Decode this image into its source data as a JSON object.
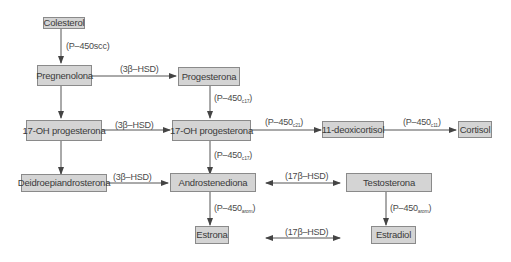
{
  "diagram": {
    "type": "steroidogenesis-pathway",
    "nodes": {
      "colesterol": "Colesterol",
      "pregnenolona": "Pregnenolona",
      "progesterona": "Progesterona",
      "oh17_progesterona_left": "17-OH progesterona",
      "oh17_progesterona_mid": "17-OH progesterona",
      "deoxicortisol": "11-deoxicortisol",
      "cortisol": "Cortisol",
      "deidroepiandrosterona": "Deidroepiandrosterona",
      "androstenediona": "Androstenediona",
      "testosterona": "Testosterona",
      "estrona": "Estrona",
      "estradiol": "Estradiol"
    },
    "enzymes": {
      "p450scc": "(P–450scc)",
      "hsd3b_1": "(3β–HSD)",
      "hsd3b_2": "(3β–HSD)",
      "hsd3b_3": "(3β–HSD)",
      "p450c17_1": {
        "base": "(P–450",
        "sub": "c17",
        "close": ")"
      },
      "p450c21": {
        "base": "(P–450",
        "sub": "c21",
        "close": ")"
      },
      "p450c11": {
        "base": "(P–450",
        "sub": "c11",
        "close": ")"
      },
      "p450c17_2": {
        "base": "(P–450",
        "sub": "c17",
        "close": ")"
      },
      "hsd17b_1": "(17β–HSD)",
      "hsd17b_2": "(17β–HSD)",
      "p450arom_1": {
        "base": "(P–450",
        "sub": "arom",
        "close": ")"
      },
      "p450arom_2": {
        "base": "(P–450",
        "sub": "arom",
        "close": ")"
      }
    },
    "edges": [
      {
        "from": "Colesterol",
        "to": "Pregnenolona",
        "enzyme": "P-450scc"
      },
      {
        "from": "Pregnenolona",
        "to": "Progesterona",
        "enzyme": "3β-HSD"
      },
      {
        "from": "Pregnenolona",
        "to": "17-OH progesterona (left)",
        "enzyme": ""
      },
      {
        "from": "Progesterona",
        "to": "17-OH progesterona",
        "enzyme": "P-450c17"
      },
      {
        "from": "17-OH progesterona (left)",
        "to": "17-OH progesterona",
        "enzyme": "3β-HSD"
      },
      {
        "from": "17-OH progesterona",
        "to": "11-deoxicortisol",
        "enzyme": "P-450c21"
      },
      {
        "from": "11-deoxicortisol",
        "to": "Cortisol",
        "enzyme": "P-450c11"
      },
      {
        "from": "17-OH progesterona (left)",
        "to": "Deidroepiandrosterona",
        "enzyme": ""
      },
      {
        "from": "17-OH progesterona",
        "to": "Androstenediona",
        "enzyme": "P-450c17"
      },
      {
        "from": "Deidroepiandrosterona",
        "to": "Androstenediona",
        "enzyme": "3β-HSD"
      },
      {
        "from": "Androstenediona",
        "to": "Testosterona",
        "enzyme": "17β-HSD",
        "bidirectional": true
      },
      {
        "from": "Androstenediona",
        "to": "Estrona",
        "enzyme": "P-450arom"
      },
      {
        "from": "Testosterona",
        "to": "Estradiol",
        "enzyme": "P-450arom"
      },
      {
        "from": "Estrona",
        "to": "Estradiol",
        "enzyme": "17β-HSD",
        "bidirectional": true
      }
    ]
  }
}
